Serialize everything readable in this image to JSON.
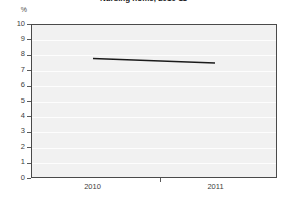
{
  "chart_data": {
    "type": "line",
    "title": "Nursing home, 2010-11",
    "xlabel": "",
    "ylabel": "%",
    "categories": [
      "2010",
      "2011"
    ],
    "x": [
      2010,
      2011
    ],
    "series": [
      {
        "name": "Nursing home",
        "values": [
          7.8,
          7.5
        ]
      }
    ],
    "ylim": [
      0,
      10
    ],
    "yticks": [
      0,
      1,
      2,
      3,
      4,
      5,
      6,
      7,
      8,
      9,
      10
    ],
    "ytick_labels": [
      "0",
      "1",
      "2",
      "3",
      "4",
      "5",
      "6",
      "7",
      "8",
      "9",
      "10"
    ],
    "xtick_labels": [
      "2010",
      "2011"
    ],
    "grid": true,
    "grid_axis": "y",
    "legend": false,
    "legend_position": "none",
    "colors": {
      "line": "#1a1a1a",
      "plot_background": "#f1f1f1",
      "plot_border": "#4a4a4a",
      "gridline": "#fdfdfd",
      "text": "#3d3d3d"
    }
  }
}
